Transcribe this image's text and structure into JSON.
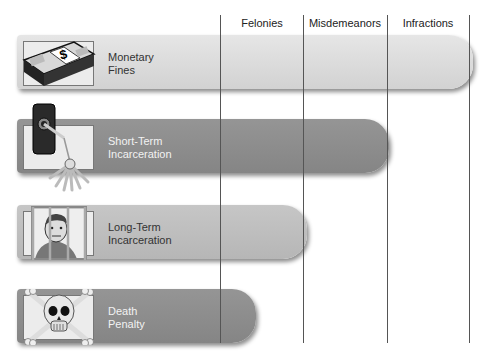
{
  "columns": [
    {
      "label": "Felonies",
      "x": 221
    },
    {
      "label": "Misdemeanors",
      "x": 304
    },
    {
      "label": "Infractions",
      "x": 387
    }
  ],
  "right_line_x": 469,
  "rows": [
    {
      "label_line1": "Monetary",
      "label_line2": "Fines",
      "icon": "money-stack-icon",
      "bar_color": "#dcdcdc",
      "text_color": "#333333",
      "top": 35,
      "right": 473,
      "applies_to": [
        "Felonies",
        "Misdemeanors",
        "Infractions"
      ]
    },
    {
      "label_line1": "Short-Term",
      "label_line2": "Incarceration",
      "icon": "jail-key-icon",
      "bar_color": "#8c8c8c",
      "text_color": "#f2f2f2",
      "top": 119,
      "right": 389,
      "applies_to": [
        "Felonies",
        "Misdemeanors",
        "Infractions"
      ]
    },
    {
      "label_line1": "Long-Term",
      "label_line2": "Incarceration",
      "icon": "prisoner-bars-icon",
      "bar_color": "#bebebe",
      "text_color": "#333333",
      "top": 205,
      "right": 307,
      "applies_to": [
        "Felonies",
        "Misdemeanors"
      ]
    },
    {
      "label_line1": "Death",
      "label_line2": "Penalty",
      "icon": "skull-crossbones-icon",
      "bar_color": "#8c8c8c",
      "text_color": "#f2f2f2",
      "top": 289,
      "right": 256,
      "applies_to": [
        "Felonies"
      ]
    }
  ]
}
